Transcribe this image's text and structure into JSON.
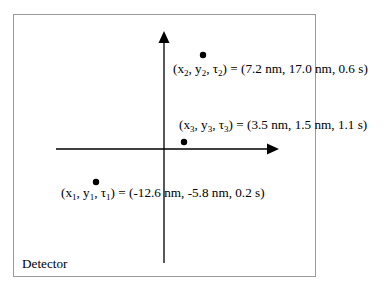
{
  "detector": {
    "label": "Detector",
    "border_color": "#9a9a9a"
  },
  "axes": {
    "color": "#000000",
    "x_axis": {
      "direction": "right"
    },
    "y_axis": {
      "direction": "up"
    }
  },
  "points": [
    {
      "id": 1,
      "sym_x": "x",
      "sym_y": "y",
      "sym_t": "τ",
      "sub": "1",
      "values": "= (-12.6 nm, -5.8 nm, 0.2 s)",
      "x_nm": -12.6,
      "y_nm": -5.8,
      "t_s": 0.2
    },
    {
      "id": 2,
      "sym_x": "x",
      "sym_y": "y",
      "sym_t": "τ",
      "sub": "2",
      "values": "= (7.2 nm, 17.0 nm, 0.6 s)",
      "x_nm": 7.2,
      "y_nm": 17.0,
      "t_s": 0.6
    },
    {
      "id": 3,
      "sym_x": "x",
      "sym_y": "y",
      "sym_t": "τ",
      "sub": "3",
      "values": "= (3.5 nm, 1.5 nm, 1.1 s)",
      "x_nm": 3.5,
      "y_nm": 1.5,
      "t_s": 1.1
    }
  ]
}
